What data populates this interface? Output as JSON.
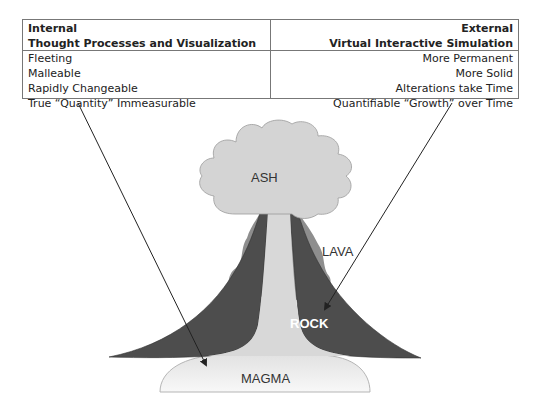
{
  "table": {
    "left": {
      "heading_line1": "Internal",
      "heading_line2": "Thought Processes and Visualization",
      "rows": [
        "Fleeting",
        "Malleable",
        "Rapidly Changeable",
        "True “Quantity” Immeasurable"
      ]
    },
    "right": {
      "heading_line1": "External",
      "heading_line2": "Virtual Interactive Simulation",
      "rows": [
        "More Permanent",
        "More Solid",
        "Alterations take Time",
        "Quantifiable “Growth” over Time"
      ]
    }
  },
  "volcano": {
    "labels": {
      "ash": "ASH",
      "lava": "LAVA",
      "rock": "ROCK",
      "magma": "MAGMA"
    },
    "colors": {
      "ash": "#d4d4d4",
      "lava": "#8e8e8e",
      "rock": "#4d4d4d",
      "magma": "#ececec",
      "conduit": "#d8d8d8",
      "arrow": "#222222"
    }
  },
  "arrows": [
    {
      "from": "internal-column",
      "to": "magma"
    },
    {
      "from": "external-column",
      "to": "rock"
    }
  ]
}
